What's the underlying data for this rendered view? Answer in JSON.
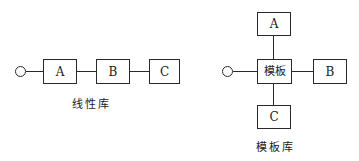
{
  "linear_library": {
    "caption": "线性库",
    "entry_point": "circle",
    "nodes": [
      {
        "id": "A",
        "label": "A"
      },
      {
        "id": "B",
        "label": "B"
      },
      {
        "id": "C",
        "label": "C"
      }
    ],
    "edges": [
      [
        "entry",
        "A"
      ],
      [
        "A",
        "B"
      ],
      [
        "B",
        "C"
      ]
    ]
  },
  "template_library": {
    "caption": "模板库",
    "entry_point": "circle",
    "center": {
      "id": "template",
      "label": "模板"
    },
    "nodes": [
      {
        "id": "A",
        "label": "A",
        "position": "top"
      },
      {
        "id": "B",
        "label": "B",
        "position": "right"
      },
      {
        "id": "C",
        "label": "C",
        "position": "bottom"
      }
    ],
    "edges": [
      [
        "entry",
        "template"
      ],
      [
        "template",
        "A"
      ],
      [
        "template",
        "B"
      ],
      [
        "template",
        "C"
      ]
    ]
  }
}
